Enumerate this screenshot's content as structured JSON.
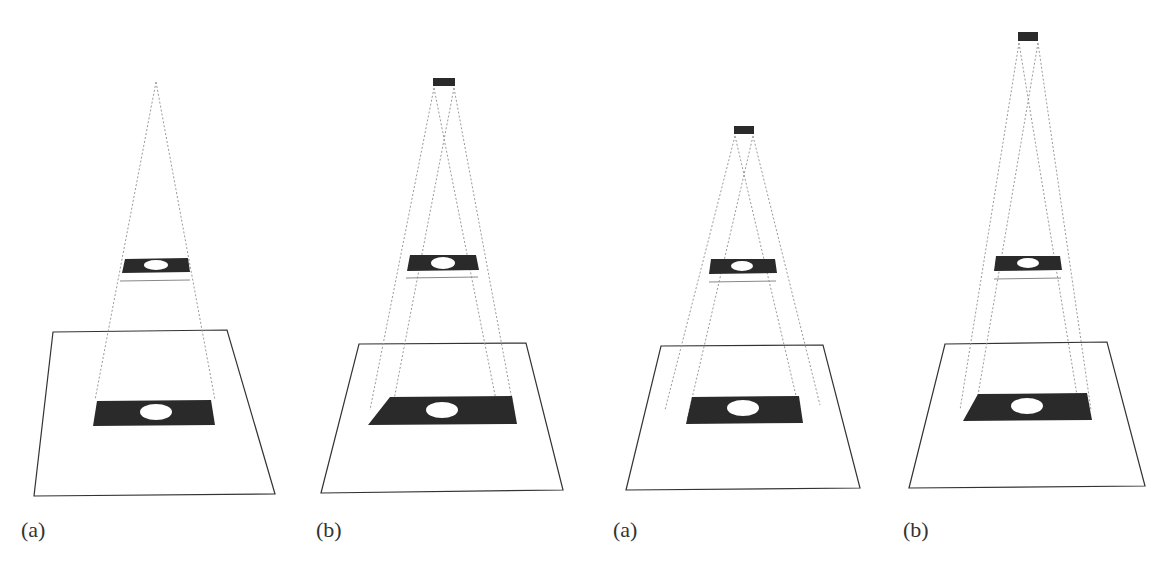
{
  "figure": {
    "panels": [
      {
        "id": "panel-1",
        "label": "(a)",
        "has_light_source_box": false,
        "projection_style": "clean"
      },
      {
        "id": "panel-2",
        "label": "(b)",
        "has_light_source_box": true,
        "projection_style": "noisy"
      },
      {
        "id": "panel-3",
        "label": "(a)",
        "has_light_source_box": true,
        "projection_style": "noisy"
      },
      {
        "id": "panel-4",
        "label": "(b)",
        "has_light_source_box": true,
        "projection_style": "noisy"
      }
    ],
    "colors": {
      "mask": "#2a2a2a",
      "frustum": "#9a9a9a",
      "plane": "#333333",
      "background": "#ffffff"
    }
  }
}
